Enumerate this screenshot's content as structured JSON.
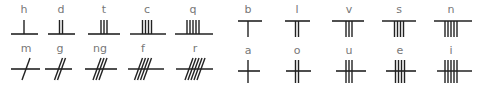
{
  "stroke_color": "#222222",
  "label_color": "#777777",
  "groups": [
    {
      "name": "aicme-beithe-left",
      "row": "top-left",
      "type": "below-left",
      "letters": [
        {
          "label": "h",
          "strokes": 1,
          "cx": 24,
          "x1": 11,
          "x2": 38
        },
        {
          "label": "d",
          "strokes": 2,
          "cx": 61,
          "x1": 48,
          "x2": 75
        },
        {
          "label": "t",
          "strokes": 3,
          "cx": 104,
          "x1": 88,
          "x2": 120
        },
        {
          "label": "c",
          "strokes": 4,
          "cx": 147,
          "x1": 130,
          "x2": 166
        },
        {
          "label": "q",
          "strokes": 5,
          "cx": 193,
          "x1": 175,
          "x2": 213
        }
      ]
    },
    {
      "name": "aicme-muine",
      "row": "bottom-left",
      "type": "diagonal",
      "letters": [
        {
          "label": "m",
          "strokes": 1,
          "cx": 26,
          "x1": 11,
          "x2": 40
        },
        {
          "label": "g",
          "strokes": 2,
          "cx": 60,
          "x1": 45,
          "x2": 72
        },
        {
          "label": "ng",
          "strokes": 3,
          "cx": 100,
          "x1": 85,
          "x2": 117
        },
        {
          "label": "f",
          "strokes": 4,
          "cx": 143,
          "x1": 128,
          "x2": 164
        },
        {
          "label": "r",
          "strokes": 5,
          "cx": 195,
          "x1": 176,
          "x2": 213
        }
      ]
    },
    {
      "name": "aicme-beithe",
      "row": "top-right",
      "type": "below",
      "letters": [
        {
          "label": "b",
          "strokes": 1,
          "cx": 248,
          "x1": 238,
          "x2": 262
        },
        {
          "label": "l",
          "strokes": 2,
          "cx": 297,
          "x1": 285,
          "x2": 310
        },
        {
          "label": "v",
          "strokes": 3,
          "cx": 349,
          "x1": 332,
          "x2": 364
        },
        {
          "label": "s",
          "strokes": 4,
          "cx": 399,
          "x1": 382,
          "x2": 416
        },
        {
          "label": "n",
          "strokes": 5,
          "cx": 451,
          "x1": 434,
          "x2": 472
        }
      ]
    },
    {
      "name": "aicme-ailme",
      "row": "bottom-right",
      "type": "across",
      "letters": [
        {
          "label": "a",
          "strokes": 1,
          "cx": 248,
          "x1": 238,
          "x2": 260
        },
        {
          "label": "o",
          "strokes": 2,
          "cx": 297,
          "x1": 286,
          "x2": 311
        },
        {
          "label": "u",
          "strokes": 3,
          "cx": 349,
          "x1": 336,
          "x2": 366
        },
        {
          "label": "e",
          "strokes": 4,
          "cx": 400,
          "x1": 386,
          "x2": 416
        },
        {
          "label": "i",
          "strokes": 5,
          "cx": 451,
          "x1": 437,
          "x2": 472
        }
      ]
    }
  ],
  "rows": {
    "top-left": {
      "label_y": 4,
      "line_y": 34,
      "stroke_top": 20,
      "stroke_bottom": 34
    },
    "bottom-left": {
      "label_y": 43,
      "line_y": 69,
      "stroke_top": 58,
      "stroke_bottom": 80
    },
    "top-right": {
      "label_y": 4,
      "line_y": 21,
      "stroke_top": 21,
      "stroke_bottom": 37
    },
    "bottom-right": {
      "label_y": 45,
      "line_y": 71,
      "stroke_top": 60,
      "stroke_bottom": 83
    }
  }
}
